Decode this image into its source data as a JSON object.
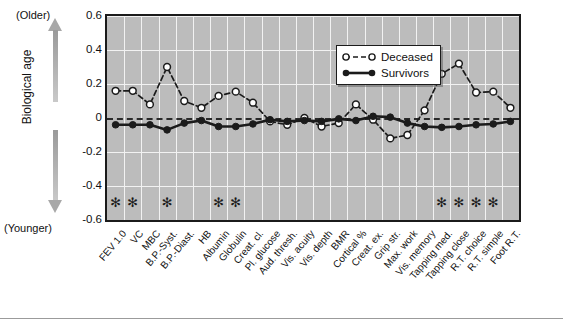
{
  "axis": {
    "y_label": "Biological age",
    "top_note": "(Older)",
    "bottom_note": "(Younger)",
    "y_ticks": [
      "0.6",
      "0.4",
      "0.2",
      "0",
      "-0.2",
      "-0.4",
      "-0.6"
    ],
    "significance_marker": "✻"
  },
  "legend": {
    "items": [
      {
        "label": "Deceased",
        "style": "open-circle-dashed",
        "color": "#1b1b1b"
      },
      {
        "label": "Survivors",
        "style": "filled-circle-solid",
        "color": "#1b1b1b"
      }
    ]
  },
  "colors": {
    "plot_background": "#bcbcbc",
    "gridline": "#f2f2f2",
    "series": "#1b1b1b",
    "axis_border": "#1b1b1b"
  },
  "chart_data": {
    "type": "line",
    "title": "",
    "xlabel": "",
    "ylabel": "Biological age",
    "ylim": [
      -0.6,
      0.6
    ],
    "ytick_values": [
      0.6,
      0.4,
      0.2,
      0,
      -0.2,
      -0.4,
      -0.6
    ],
    "grid": true,
    "legend_position": "top-center",
    "zero_reference_line": 0,
    "categories": [
      "FEV 1.0",
      "VC",
      "MBC",
      "B.P.-Syst.",
      "B.P.-Diast.",
      "HB",
      "Albumin",
      "Globulin",
      "Creat. cl.",
      "Pl. glucose",
      "Aud. thresh.",
      "Vis. acuity",
      "Vis. depth",
      "BMR",
      "Cortical %",
      "Creat. ex.",
      "Grip str.",
      "Max. work",
      "Vis. memory",
      "Tapping med.",
      "Tapping close",
      "R.T. choice",
      "R.T. simple",
      "Foot R.T."
    ],
    "series": [
      {
        "name": "Deceased",
        "values": [
          0.16,
          0.16,
          0.08,
          0.3,
          0.1,
          0.06,
          0.13,
          0.155,
          0.09,
          -0.02,
          -0.04,
          0.0,
          -0.05,
          -0.03,
          0.08,
          -0.01,
          -0.12,
          -0.1,
          0.045,
          0.26,
          0.32,
          0.15,
          0.155,
          0.06
        ]
      },
      {
        "name": "Survivors",
        "values": [
          -0.04,
          -0.04,
          -0.04,
          -0.07,
          -0.03,
          -0.015,
          -0.05,
          -0.05,
          -0.035,
          -0.01,
          -0.02,
          -0.015,
          -0.02,
          -0.005,
          -0.015,
          0.01,
          0.005,
          -0.03,
          -0.05,
          -0.055,
          -0.05,
          -0.04,
          -0.035,
          -0.02
        ]
      }
    ],
    "significance_marked_categories": [
      "FEV 1.0",
      "VC",
      "B.P.-Syst.",
      "Albumin",
      "Globulin",
      "Tapping med.",
      "Tapping close",
      "R.T. choice",
      "R.T. simple"
    ]
  }
}
